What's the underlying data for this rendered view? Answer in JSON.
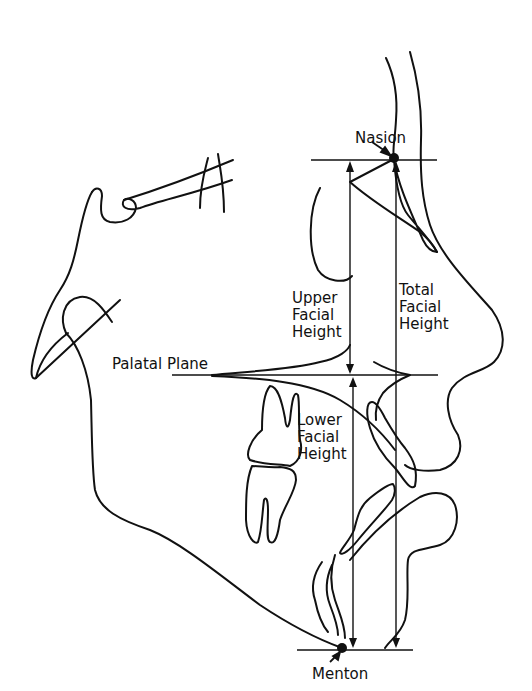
{
  "diagram": {
    "type": "cephalometric tracing (lateral profile)",
    "labels": {
      "nasion": "Nasion",
      "menton": "Menton",
      "palatal_plane": "Palatal Plane",
      "upper_facial_height": [
        "Upper",
        "Facial",
        "Height"
      ],
      "lower_facial_height": [
        "Lower",
        "Facial",
        "Height"
      ],
      "total_facial_height": [
        "Total",
        "Facial",
        "Height"
      ]
    },
    "landmarks": [
      {
        "name": "Nasion",
        "x": 394,
        "y": 158
      },
      {
        "name": "Menton",
        "x": 342,
        "y": 648
      }
    ],
    "measurements": [
      {
        "name": "Upper Facial Height",
        "from": "Nasion level",
        "to": "Palatal Plane"
      },
      {
        "name": "Lower Facial Height",
        "from": "Palatal Plane",
        "to": "Menton level"
      },
      {
        "name": "Total Facial Height",
        "from": "Nasion",
        "to": "Menton level"
      }
    ],
    "colors": {
      "ink": "#111111",
      "background": "#ffffff"
    }
  }
}
